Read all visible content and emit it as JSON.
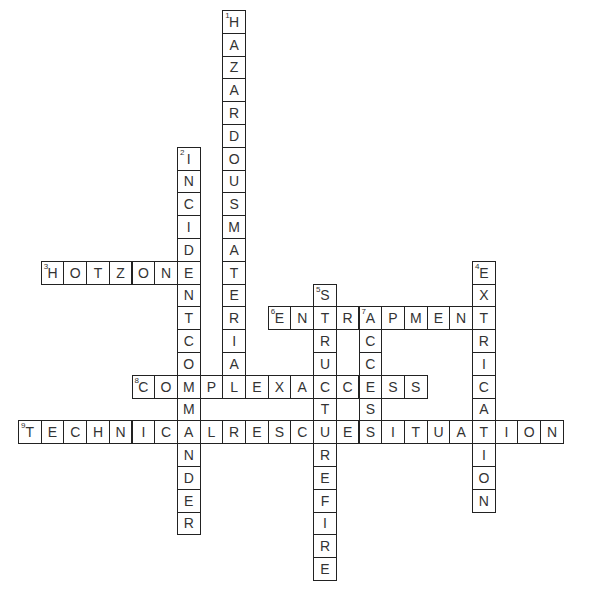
{
  "puzzle": {
    "cell_w": 22.7,
    "cell_h": 22.8,
    "origin_x": 18,
    "origin_y": 10,
    "entries": [
      {
        "number": 1,
        "direction": "down",
        "answer": "HAZARDOUSMATERIAL",
        "col": 9,
        "row": 0
      },
      {
        "number": 2,
        "direction": "down",
        "answer": "INCIDENTCOMMANDER",
        "col": 7,
        "row": 6
      },
      {
        "number": 3,
        "direction": "across",
        "answer": "HOTZONE",
        "col": 1,
        "row": 11
      },
      {
        "number": 4,
        "direction": "down",
        "answer": "EXTRICATION",
        "col": 20,
        "row": 11
      },
      {
        "number": 5,
        "direction": "down",
        "answer": "STRUCTUREFIRE",
        "col": 13,
        "row": 12
      },
      {
        "number": 6,
        "direction": "across",
        "answer": "ENTRAPMENT",
        "col": 11,
        "row": 13
      },
      {
        "number": 7,
        "direction": "down",
        "answer": "ACCESS",
        "col": 15,
        "row": 13
      },
      {
        "number": 8,
        "direction": "across",
        "answer": "COMPLEXACCESS",
        "col": 5,
        "row": 16
      },
      {
        "number": 9,
        "direction": "across",
        "answer": "TECHNICALRESCUESITUATION",
        "col": 0,
        "row": 18
      }
    ]
  }
}
